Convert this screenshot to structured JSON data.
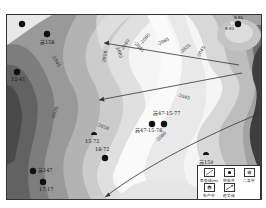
{
  "map": {
    "type": "contour-map",
    "colors": {
      "darkest": "#3a3a3a",
      "dark": "#5c5c5c",
      "mid_dark": "#7a7a7a",
      "mid": "#999999",
      "mid_light": "#b5b5b5",
      "light": "#cfcfcf",
      "lighter": "#e2e2e2",
      "lightest": "#f7f7f7"
    }
  },
  "wells": [
    {
      "id": "w1",
      "label": "",
      "type": "exploration"
    },
    {
      "id": "w2",
      "label": "苏158",
      "type": "exploration"
    },
    {
      "id": "w3",
      "label": "12-41",
      "type": "exploration"
    },
    {
      "id": "w4",
      "label": "9-84",
      "type": "exploration"
    },
    {
      "id": "w5",
      "label": "9-83",
      "type": "secondary"
    },
    {
      "id": "w6",
      "label": "苏47-15-77",
      "type": "exploration"
    },
    {
      "id": "w7",
      "label": "苏47-15-76",
      "type": "exploration"
    },
    {
      "id": "w8",
      "label": "15-72",
      "type": "low-yield"
    },
    {
      "id": "w9",
      "label": "18-72",
      "type": "exploration"
    },
    {
      "id": "w10",
      "label": "苏147",
      "type": "exploration"
    },
    {
      "id": "w11",
      "label": "17-17",
      "type": "exploration"
    },
    {
      "id": "w12",
      "label": "苏159",
      "type": "low-yield"
    }
  ],
  "contour_labels": [
    "-2045",
    "-2010",
    "-2005",
    "-2040",
    "-2045",
    "-2060",
    "-2065",
    "-2025",
    "-2045",
    "-2070",
    "-2050",
    "-2045",
    "-2080"
  ],
  "legend": {
    "items": [
      {
        "label": "等值线(m)",
        "icon": "contour-line-icon"
      },
      {
        "label": "空验井",
        "icon": "exploration-well-icon"
      },
      {
        "label": "二类井",
        "icon": "secondary-well-icon"
      },
      {
        "label": "低产井",
        "icon": "low-yield-well-icon"
      },
      {
        "label": "趋势线",
        "icon": "trend-line-icon"
      }
    ]
  }
}
